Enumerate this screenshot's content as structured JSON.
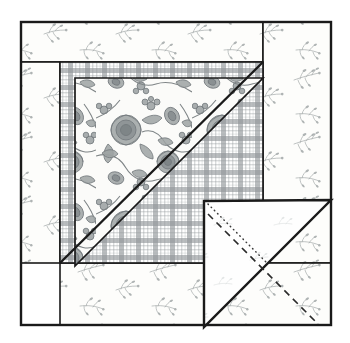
{
  "canvas": {
    "width": 350,
    "height": 343,
    "background": "#ffffff"
  },
  "diagram": {
    "line_color": "#1a1a1a",
    "outline": {
      "name": "block-outline",
      "x": 21,
      "y": 22,
      "width": 310,
      "height": 303,
      "stroke_width": 2.4
    },
    "fabrics": [
      {
        "id": "floral-sprig",
        "label": "Light floral sprig print",
        "base_color": "#fdfdfb",
        "motif_color": "#9aa0a0",
        "scale": "small"
      },
      {
        "id": "gray-plaid",
        "label": "Gray gingham plaid",
        "base_color": "#ffffff",
        "band_color": "#8d9396",
        "thin_color": "#b9bec0",
        "scale": "medium"
      },
      {
        "id": "rose-floral",
        "label": "Large gray rose floral print",
        "base_color": "#fbfbf9",
        "motif_color": "#8e9394",
        "outline_color": "#6e7375",
        "scale": "large"
      },
      {
        "id": "plain-white",
        "label": "Plain white backing",
        "base_color": "#fefefe",
        "motif_color": "#d8dcdc",
        "scale": "sparse"
      }
    ],
    "pieces": [
      {
        "name": "top-border-strip",
        "fabric": "floral-sprig",
        "shape": "rect",
        "x": 21,
        "y": 22,
        "width": 242,
        "height": 40
      },
      {
        "name": "right-border-strip",
        "fabric": "floral-sprig",
        "shape": "rect",
        "x": 263,
        "y": 22,
        "width": 68,
        "height": 241
      },
      {
        "name": "bottom-border-strip",
        "fabric": "floral-sprig",
        "shape": "rect",
        "x": 60,
        "y": 263,
        "width": 271,
        "height": 62
      },
      {
        "name": "left-border-strip",
        "fabric": "floral-sprig",
        "shape": "rect",
        "x": 21,
        "y": 62,
        "width": 39,
        "height": 201
      },
      {
        "name": "plaid-triangle",
        "fabric": "gray-plaid",
        "shape": "polygon",
        "points": "60,62 263,62 263,263 60,263"
      },
      {
        "name": "floral-center-triangle",
        "fabric": "rose-floral",
        "shape": "polygon",
        "points": "75,78 263,78 75,266"
      },
      {
        "name": "folded-corner-flap",
        "fabric": "plain-white",
        "shape": "polygon",
        "points": "204,201 331,200 204,327"
      }
    ],
    "seam_lines": [
      {
        "name": "plaid-diagonal-seam",
        "x1": 60,
        "y1": 263,
        "x2": 263,
        "y2": 62,
        "width": 2.4,
        "style": "solid"
      },
      {
        "name": "floral-diagonal-seam",
        "x1": 75,
        "y1": 266,
        "x2": 263,
        "y2": 78,
        "width": 2.0,
        "style": "solid"
      }
    ],
    "flap_markings": [
      {
        "name": "fold-line",
        "style": "dotted",
        "x1": 207,
        "y1": 203,
        "x2": 331,
        "y2": 202,
        "note": "diagonal dotted fold indicator"
      },
      {
        "name": "stitch-line",
        "style": "dashed",
        "note": "dashed stitching line parallel to hypotenuse"
      }
    ]
  }
}
